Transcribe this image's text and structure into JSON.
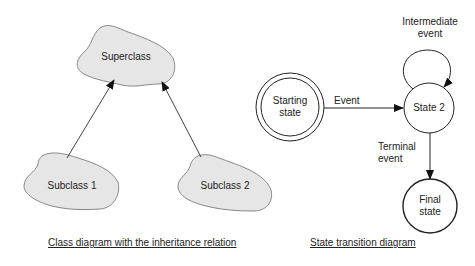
{
  "class_diagram": {
    "superclass": "Superclass",
    "subclass_1": "Subclass 1",
    "subclass_2": "Subclass 2",
    "caption": "Class diagram with the inheritance relation",
    "colors": {
      "cloud_fill": "#e6e6e6",
      "cloud_stroke": "#888888",
      "arrow": "#333333"
    }
  },
  "state_diagram": {
    "starting_state_line1": "Starting",
    "starting_state_line2": "state",
    "state_2": "State 2",
    "final_state_line1": "Final",
    "final_state_line2": "state",
    "event_label": "Event",
    "intermediate_event_line1": "Intermediate",
    "intermediate_event_line2": "event",
    "terminal_event_line1": "Terminal",
    "terminal_event_line2": "event",
    "caption": "State transition diagram"
  }
}
